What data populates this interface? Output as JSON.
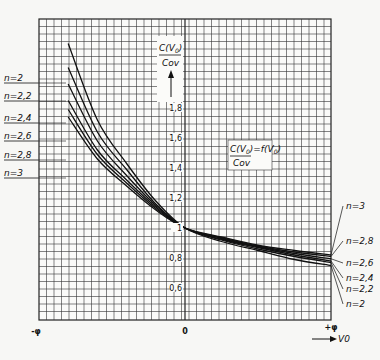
{
  "chart_data": {
    "type": "line",
    "xlabel": "V0",
    "ylabel": "C(V0)/Cov",
    "x_tick_labels": [
      "-φ",
      "0",
      "+φ"
    ],
    "y_tick_labels": [
      "0,6",
      "0,8",
      "1",
      "1,2",
      "1,4",
      "1,6",
      "1,8",
      "2"
    ],
    "ylim": [
      0.4,
      2.35
    ],
    "xlim": [
      -1,
      1
    ],
    "grid": true,
    "x": [
      -0.8,
      -0.6,
      -0.4,
      -0.2,
      0,
      0.25,
      0.5,
      0.75,
      1.0
    ],
    "series": [
      {
        "name": "n=2",
        "values": [
          2.23,
          1.72,
          1.43,
          1.18,
          1.0,
          0.91,
          0.85,
          0.79,
          0.75
        ]
      },
      {
        "name": "n=2,2",
        "values": [
          2.07,
          1.64,
          1.39,
          1.16,
          1.0,
          0.92,
          0.86,
          0.81,
          0.77
        ]
      },
      {
        "name": "n=2,4",
        "values": [
          1.96,
          1.58,
          1.35,
          1.15,
          1.0,
          0.925,
          0.87,
          0.82,
          0.78
        ]
      },
      {
        "name": "n=2,6",
        "values": [
          1.85,
          1.52,
          1.32,
          1.14,
          1.0,
          0.93,
          0.875,
          0.83,
          0.795
        ]
      },
      {
        "name": "n=2,8",
        "values": [
          1.79,
          1.49,
          1.3,
          1.13,
          1.0,
          0.935,
          0.88,
          0.84,
          0.81
        ]
      },
      {
        "name": "n=3",
        "values": [
          1.74,
          1.46,
          1.28,
          1.12,
          1.0,
          0.94,
          0.885,
          0.85,
          0.82
        ]
      }
    ],
    "legend_left": [
      "n=2",
      "n=2,2",
      "n=2,4",
      "n=2,6",
      "n=2,8",
      "n=3"
    ],
    "legend_right": [
      "n=3",
      "n=2,8",
      "n=2,6",
      "n=2,4",
      "n=2,2",
      "n=2"
    ],
    "annotations": [
      "C(V0)/Cov = f(V0)"
    ]
  },
  "labels": {
    "y_axis_num": "C(V",
    "y_axis_den": "Cov",
    "formula_num": "C(V",
    "formula_den": "Cov",
    "formula_rhs": "=f(V",
    "x_axis": "V",
    "sub0": "0",
    "close": ")"
  }
}
